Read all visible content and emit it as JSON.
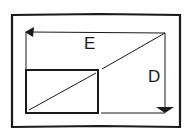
{
  "diagram": {
    "labels": {
      "horizontal": "E",
      "vertical": "D"
    },
    "colors": {
      "ink": "#1a1a1a",
      "background": "#ffffff"
    }
  }
}
